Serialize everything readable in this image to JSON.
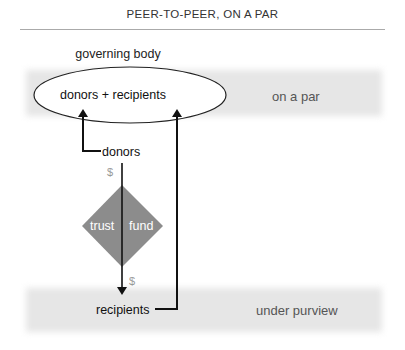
{
  "title": "PEER-TO-PEER, ON A PAR",
  "diagram": {
    "governing_body_label": "governing body",
    "ellipse_label": "donors + recipients",
    "top_band_label": "on a par",
    "donors_label": "donors",
    "currency_symbol_top": "$",
    "currency_symbol_bottom": "$",
    "fund_left_label": "trust",
    "fund_right_label": "fund",
    "recipients_label": "recipients",
    "bottom_band_label": "under purview"
  },
  "colors": {
    "band": "#e6e6e6",
    "diamond": "#8c8c8c",
    "line": "#111111",
    "muted_text": "#555555",
    "currency": "#999999"
  }
}
